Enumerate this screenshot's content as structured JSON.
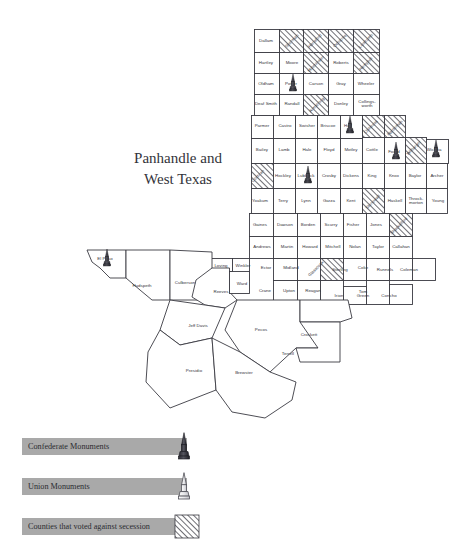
{
  "title": {
    "line1": "Panhandle and",
    "line2": "West Texas"
  },
  "legend": {
    "items": [
      {
        "label": "Confederate Monuments",
        "symbol": "confederate-obelisk",
        "color": "#3d3d45"
      },
      {
        "label": "Union Monuments",
        "symbol": "union-obelisk",
        "color": "#ffffff"
      },
      {
        "label": "Counties that voted against secession",
        "symbol": "hatch-swatch",
        "color": "#8a8a92"
      }
    ],
    "bar_color": "#a9a9a9"
  },
  "map": {
    "region": "Panhandle and West Texas",
    "counties": [
      {
        "name": "Dallam",
        "x": 266,
        "y": 41,
        "hatched": false,
        "monument": null
      },
      {
        "name": "Sherman",
        "x": 292,
        "y": 41,
        "hatched": true,
        "monument": null,
        "rotate": -45
      },
      {
        "name": "Hansford",
        "x": 315,
        "y": 41,
        "hatched": true,
        "monument": null,
        "rotate": -45
      },
      {
        "name": "Ochiltree",
        "x": 340,
        "y": 41,
        "hatched": true,
        "monument": null,
        "rotate": -45
      },
      {
        "name": "Lipscomb",
        "x": 366,
        "y": 41,
        "hatched": true,
        "monument": null,
        "rotate": -45
      },
      {
        "name": "Hartley",
        "x": 266,
        "y": 63,
        "hatched": false,
        "monument": null
      },
      {
        "name": "Moore",
        "x": 292,
        "y": 63,
        "hatched": false,
        "monument": null
      },
      {
        "name": "Hutchinson",
        "x": 316,
        "y": 64,
        "hatched": true,
        "monument": null,
        "rotate": -45
      },
      {
        "name": "Roberts",
        "x": 341,
        "y": 63,
        "hatched": false,
        "monument": null
      },
      {
        "name": "Hemphill",
        "x": 366,
        "y": 64,
        "hatched": true,
        "monument": null,
        "rotate": -45
      },
      {
        "name": "Oldham",
        "x": 266,
        "y": 84,
        "hatched": false,
        "monument": null
      },
      {
        "name": "Potter",
        "x": 291,
        "y": 84,
        "hatched": false,
        "monument": "confederate"
      },
      {
        "name": "Carson",
        "x": 316,
        "y": 84,
        "hatched": false,
        "monument": null
      },
      {
        "name": "Gray",
        "x": 341,
        "y": 84,
        "hatched": false,
        "monument": null
      },
      {
        "name": "Wheeler",
        "x": 366,
        "y": 84,
        "hatched": false,
        "monument": null
      },
      {
        "name": "Deaf Smith",
        "x": 266,
        "y": 104,
        "hatched": false,
        "monument": null
      },
      {
        "name": "Randall",
        "x": 292,
        "y": 104,
        "hatched": false,
        "monument": null
      },
      {
        "name": "Armstrong",
        "x": 317,
        "y": 105,
        "hatched": true,
        "monument": null,
        "rotate": -45
      },
      {
        "name": "Donley",
        "x": 341,
        "y": 104,
        "hatched": false,
        "monument": null
      },
      {
        "name": "Collingsworth",
        "x": 367,
        "y": 104,
        "hatched": false,
        "monument": null
      },
      {
        "name": "Parmer",
        "x": 262,
        "y": 126,
        "hatched": false,
        "monument": null
      },
      {
        "name": "Castro",
        "x": 285,
        "y": 126,
        "hatched": false,
        "monument": null
      },
      {
        "name": "Swisher",
        "x": 307,
        "y": 126,
        "hatched": false,
        "monument": null
      },
      {
        "name": "Briscoe",
        "x": 328,
        "y": 126,
        "hatched": false,
        "monument": null
      },
      {
        "name": "Hall",
        "x": 348,
        "y": 126,
        "hatched": false,
        "monument": "confederate"
      },
      {
        "name": "Childress",
        "x": 371,
        "y": 127,
        "hatched": true,
        "monument": null,
        "rotate": -45
      },
      {
        "name": "Hardeman",
        "x": 395,
        "y": 128,
        "hatched": true,
        "monument": null,
        "rotate": -45
      },
      {
        "name": "Bailey",
        "x": 262,
        "y": 150,
        "hatched": false,
        "monument": null
      },
      {
        "name": "Lamb",
        "x": 284,
        "y": 150,
        "hatched": false,
        "monument": null
      },
      {
        "name": "Hale",
        "x": 307,
        "y": 150,
        "hatched": false,
        "monument": null
      },
      {
        "name": "Floyd",
        "x": 329,
        "y": 150,
        "hatched": false,
        "monument": null
      },
      {
        "name": "Motley",
        "x": 351,
        "y": 150,
        "hatched": false,
        "monument": null
      },
      {
        "name": "Cottle",
        "x": 372,
        "y": 150,
        "hatched": false,
        "monument": null
      },
      {
        "name": "Foard",
        "x": 394,
        "y": 152,
        "hatched": false,
        "monument": "confederate"
      },
      {
        "name": "Wilbarger",
        "x": 414,
        "y": 148,
        "hatched": true,
        "monument": null,
        "rotate": -45
      },
      {
        "name": "Wichita",
        "x": 434,
        "y": 150,
        "hatched": false,
        "monument": "confederate"
      },
      {
        "name": "Cochran",
        "x": 258,
        "y": 176,
        "hatched": true,
        "monument": null,
        "rotate": -45
      },
      {
        "name": "Hockley",
        "x": 283,
        "y": 176,
        "hatched": false,
        "monument": null
      },
      {
        "name": "Lubbock",
        "x": 306,
        "y": 176,
        "hatched": false,
        "monument": "confederate"
      },
      {
        "name": "Crosby",
        "x": 329,
        "y": 176,
        "hatched": false,
        "monument": null
      },
      {
        "name": "Dickens",
        "x": 351,
        "y": 176,
        "hatched": false,
        "monument": null
      },
      {
        "name": "King",
        "x": 372,
        "y": 176,
        "hatched": false,
        "monument": null
      },
      {
        "name": "Knox",
        "x": 394,
        "y": 176,
        "hatched": false,
        "monument": null
      },
      {
        "name": "Baylor",
        "x": 415,
        "y": 176,
        "hatched": false,
        "monument": null
      },
      {
        "name": "Archer",
        "x": 437,
        "y": 176,
        "hatched": false,
        "monument": null
      },
      {
        "name": "Yoakum",
        "x": 260,
        "y": 201,
        "hatched": false,
        "monument": null
      },
      {
        "name": "Terry",
        "x": 283,
        "y": 201,
        "hatched": false,
        "monument": null
      },
      {
        "name": "Lynn",
        "x": 306,
        "y": 201,
        "hatched": false,
        "monument": null
      },
      {
        "name": "Garza",
        "x": 329,
        "y": 201,
        "hatched": false,
        "monument": null
      },
      {
        "name": "Kent",
        "x": 351,
        "y": 201,
        "hatched": false,
        "monument": null
      },
      {
        "name": "Stonewall",
        "x": 373,
        "y": 202,
        "hatched": true,
        "monument": null,
        "rotate": -45
      },
      {
        "name": "Haskell",
        "x": 395,
        "y": 201,
        "hatched": false,
        "monument": null
      },
      {
        "name": "Throckmorton",
        "x": 416,
        "y": 201,
        "hatched": false,
        "monument": null
      },
      {
        "name": "Young",
        "x": 438,
        "y": 201,
        "hatched": false,
        "monument": null
      },
      {
        "name": "Gaines",
        "x": 260,
        "y": 225,
        "hatched": false,
        "monument": null
      },
      {
        "name": "Dawson",
        "x": 285,
        "y": 225,
        "hatched": false,
        "monument": null
      },
      {
        "name": "Borden",
        "x": 308,
        "y": 225,
        "hatched": false,
        "monument": null
      },
      {
        "name": "Scurry",
        "x": 331,
        "y": 225,
        "hatched": false,
        "monument": null
      },
      {
        "name": "Fisher",
        "x": 353,
        "y": 225,
        "hatched": false,
        "monument": null
      },
      {
        "name": "Jones",
        "x": 376,
        "y": 225,
        "hatched": false,
        "monument": null
      },
      {
        "name": "Shackelford",
        "x": 399,
        "y": 226,
        "hatched": true,
        "monument": null,
        "rotate": -45
      },
      {
        "name": "Andrews",
        "x": 262,
        "y": 247,
        "hatched": false,
        "monument": null
      },
      {
        "name": "Martin",
        "x": 287,
        "y": 247,
        "hatched": false,
        "monument": null
      },
      {
        "name": "Howard",
        "x": 310,
        "y": 247,
        "hatched": false,
        "monument": null
      },
      {
        "name": "Mitchell",
        "x": 333,
        "y": 247,
        "hatched": false,
        "monument": null
      },
      {
        "name": "Nolan",
        "x": 355,
        "y": 247,
        "hatched": false,
        "monument": null
      },
      {
        "name": "Taylor",
        "x": 378,
        "y": 247,
        "hatched": false,
        "monument": null
      },
      {
        "name": "Callahan",
        "x": 401,
        "y": 247,
        "hatched": false,
        "monument": null
      },
      {
        "name": "El Paso",
        "x": 105,
        "y": 259,
        "hatched": false,
        "monument": "confederate"
      },
      {
        "name": "Loving",
        "x": 221,
        "y": 266,
        "hatched": false,
        "monument": null
      },
      {
        "name": "Winkler",
        "x": 243,
        "y": 266,
        "hatched": false,
        "monument": null
      },
      {
        "name": "Ector",
        "x": 266,
        "y": 268,
        "hatched": false,
        "monument": null
      },
      {
        "name": "Midland",
        "x": 291,
        "y": 268,
        "hatched": false,
        "monument": null
      },
      {
        "name": "Glasscock",
        "x": 316,
        "y": 269,
        "hatched": true,
        "monument": null,
        "rotate": -45
      },
      {
        "name": "Sterling",
        "x": 340,
        "y": 270,
        "hatched": false,
        "monument": null
      },
      {
        "name": "Coke",
        "x": 363,
        "y": 268,
        "hatched": false,
        "monument": null
      },
      {
        "name": "Runnels",
        "x": 385,
        "y": 270,
        "hatched": false,
        "monument": null
      },
      {
        "name": "Coleman",
        "x": 409,
        "y": 270,
        "hatched": false,
        "monument": null
      },
      {
        "name": "Hudspeth",
        "x": 142,
        "y": 286,
        "hatched": false,
        "monument": null
      },
      {
        "name": "Culberson",
        "x": 185,
        "y": 283,
        "hatched": false,
        "monument": null
      },
      {
        "name": "Reeves",
        "x": 221,
        "y": 292,
        "hatched": false,
        "monument": null
      },
      {
        "name": "Ward",
        "x": 242,
        "y": 284,
        "hatched": false,
        "monument": null
      },
      {
        "name": "Crane",
        "x": 265,
        "y": 291,
        "hatched": false,
        "monument": null
      },
      {
        "name": "Upton",
        "x": 289,
        "y": 291,
        "hatched": false,
        "monument": null
      },
      {
        "name": "Reagan",
        "x": 313,
        "y": 291,
        "hatched": false,
        "monument": null
      },
      {
        "name": "Irion",
        "x": 339,
        "y": 296,
        "hatched": false,
        "monument": null
      },
      {
        "name": "Tom Green",
        "x": 363,
        "y": 294,
        "hatched": false,
        "monument": null
      },
      {
        "name": "Concho",
        "x": 389,
        "y": 296,
        "hatched": false,
        "monument": null
      },
      {
        "name": "Jeff Davis",
        "x": 198,
        "y": 326,
        "hatched": false,
        "monument": null
      },
      {
        "name": "Pecos",
        "x": 261,
        "y": 330,
        "hatched": false,
        "monument": null
      },
      {
        "name": "Crockett",
        "x": 309,
        "y": 335,
        "hatched": false,
        "monument": null
      },
      {
        "name": "Terrell",
        "x": 288,
        "y": 354,
        "hatched": false,
        "monument": null
      },
      {
        "name": "Presidio",
        "x": 194,
        "y": 371,
        "hatched": false,
        "monument": null
      },
      {
        "name": "Brewster",
        "x": 244,
        "y": 373,
        "hatched": false,
        "monument": null
      }
    ],
    "monument_counts": {
      "confederate": 6,
      "union": 0
    },
    "hatched_count": 13
  }
}
